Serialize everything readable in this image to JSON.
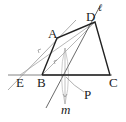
{
  "figure": {
    "type": "geometric construction",
    "labels": {
      "A": "A",
      "B": "B",
      "C": "C",
      "D": "D",
      "E": "E",
      "P": "P",
      "m": "m",
      "l": "ℓ"
    },
    "colors": {
      "bold_line": "#222222",
      "thin_line": "#555555",
      "aux_line": "#999999",
      "background": "#ffffff"
    }
  }
}
